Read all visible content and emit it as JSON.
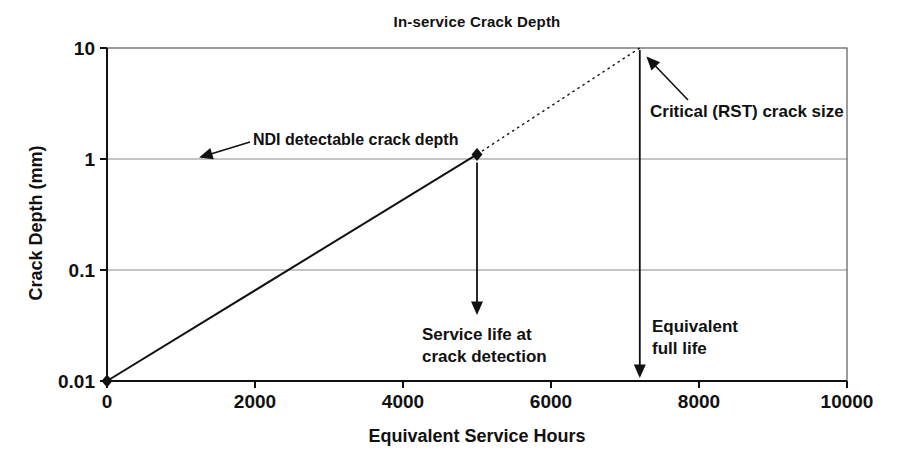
{
  "title": "In-service Crack Depth",
  "chart_data": {
    "type": "line",
    "title": "In-service Crack Depth",
    "xlabel": "Equivalent Service Hours",
    "ylabel": "Crack Depth (mm)",
    "x_scale": "linear",
    "y_scale": "log",
    "xlim": [
      0,
      10000
    ],
    "ylim": [
      0.01,
      10
    ],
    "x_ticks": [
      0,
      2000,
      4000,
      6000,
      8000,
      10000
    ],
    "y_ticks": [
      0.01,
      0.1,
      1,
      10
    ],
    "grid": "horizontal-only",
    "legend": "none",
    "series": [
      {
        "name": "observed-crack-growth",
        "style": "solid",
        "marker": "diamond",
        "points": [
          [
            0,
            0.01
          ],
          [
            5000,
            1.1
          ]
        ]
      },
      {
        "name": "projected-crack-growth",
        "style": "dashed",
        "marker": "none",
        "points": [
          [
            5000,
            1.1
          ],
          [
            7200,
            10
          ]
        ]
      }
    ],
    "reference_values": {
      "ndi_detectable_crack_depth_mm": 1,
      "critical_crack_size_mm": 10,
      "detection_crack_depth_mm": 1.1,
      "service_life_at_crack_detection_hours": 5000,
      "equivalent_full_life_hours": 7200
    }
  },
  "annotations": {
    "ndi": {
      "text": "NDI detectable crack depth"
    },
    "critical": {
      "text": "Critical (RST) crack size"
    },
    "service_life": {
      "line1": "Service life at",
      "line2": "crack detection"
    },
    "full_life": {
      "line1": "Equivalent",
      "line2": "full life"
    }
  },
  "colors": {
    "ink": "#111111",
    "grid": "#8a8a8a",
    "frame": "#5a5a5a",
    "background": "#ffffff"
  }
}
